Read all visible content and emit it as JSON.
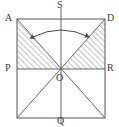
{
  "figure": {
    "type": "geometry-diagram",
    "background_color": "#ffffff",
    "stroke_color": "#555555",
    "hatch_color": "#8a8a8a",
    "label_color": "#3a3a3a"
  },
  "labels": {
    "a": "A",
    "d": "D",
    "s": "S",
    "p": "P",
    "r": "R",
    "o": "O",
    "q": "Q"
  },
  "geometry": {
    "square": {
      "top_left": [
        17,
        19
      ],
      "top_right": [
        105,
        19
      ],
      "bottom_right": [
        105,
        118
      ],
      "bottom_left": [
        17,
        118
      ]
    },
    "center_o": [
      61,
      69
    ],
    "midline_pr": {
      "from": [
        17,
        69
      ],
      "to": [
        105,
        69
      ]
    },
    "axis_sq": {
      "from": [
        61,
        8
      ],
      "to": [
        61,
        124
      ]
    },
    "diagonals": [
      {
        "from": [
          17,
          19
        ],
        "to": [
          105,
          118
        ]
      },
      {
        "from": [
          105,
          19
        ],
        "to": [
          17,
          118
        ]
      }
    ],
    "hatched_regions": [
      {
        "name": "triangle-A-P-O",
        "points": "17,19 17,69 61,69"
      },
      {
        "name": "triangle-D-R-O",
        "points": "105,19 105,69 61,69"
      }
    ],
    "rotation_arrow": {
      "path": "M 33,37 Q 61,23 89,37",
      "double_headed": true
    }
  }
}
